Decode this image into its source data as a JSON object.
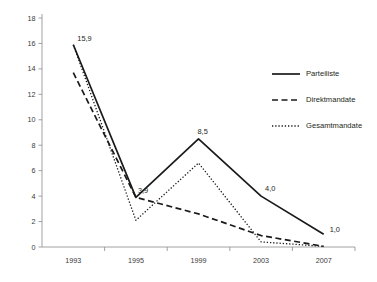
{
  "chart_data": {
    "type": "line",
    "title": "",
    "subtitle": "",
    "xlabel": "",
    "ylabel": "",
    "categories": [
      "1993",
      "1995",
      "1999",
      "2003",
      "2007"
    ],
    "ylim": [
      0,
      18
    ],
    "ytick_step": 2,
    "yticks": [
      "0",
      "2",
      "4",
      "6",
      "8",
      "10",
      "12",
      "14",
      "16",
      "18"
    ],
    "grid": false,
    "legend_position": "upper-right",
    "series": [
      {
        "name": "Parteiliste",
        "style": "solid",
        "color": "#1a1a1a",
        "values": [
          15.9,
          3.9,
          8.5,
          4.0,
          1.0
        ]
      },
      {
        "name": "Direktmandate",
        "style": "dashed",
        "color": "#1a1a1a",
        "values": [
          13.7,
          3.9,
          2.6,
          0.9,
          0.05
        ]
      },
      {
        "name": "Gesamtmandate",
        "style": "dotted",
        "color": "#1a1a1a",
        "values": [
          15.9,
          2.1,
          6.6,
          0.4,
          0.05
        ]
      }
    ],
    "annotations": [
      {
        "text": "15,9",
        "category": "1993",
        "value": 15.9,
        "series": "Parteiliste"
      },
      {
        "text": "3,9",
        "category": "1995",
        "value": 3.9,
        "series": "Parteiliste"
      },
      {
        "text": "8,5",
        "category": "1999",
        "value": 8.5,
        "series": "Parteiliste"
      },
      {
        "text": "4,0",
        "category": "2003",
        "value": 4.0,
        "series": "Parteiliste"
      },
      {
        "text": "1,0",
        "category": "2007",
        "value": 1.0,
        "series": "Parteiliste"
      }
    ]
  }
}
